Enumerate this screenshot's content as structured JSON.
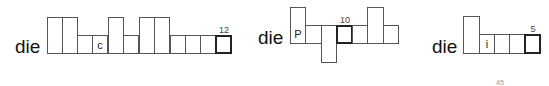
{
  "puzzles": [
    {
      "prefix": "die",
      "letters": {
        "c": "c"
      },
      "number": "12"
    },
    {
      "prefix": "die",
      "letters": {
        "p": "P"
      },
      "number": "10"
    },
    {
      "prefix": "die",
      "letters": {
        "i": "i"
      },
      "number": "5"
    }
  ],
  "page_number": "45"
}
